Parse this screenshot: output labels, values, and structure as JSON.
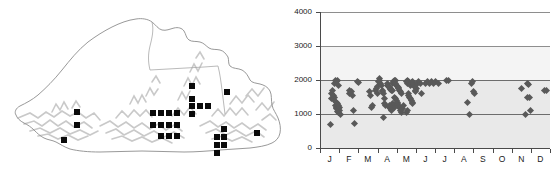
{
  "figure": {
    "panels": [
      "distribution-map",
      "altitude-month-scatter"
    ]
  },
  "map": {
    "region_name": "Bhutan",
    "outline_color": "#9a9a9a",
    "terrain_color": "#c8c8c8",
    "marker_color": "#0a0a0a",
    "marker_shape": "square",
    "marker_size_px": 6,
    "records": [
      {
        "x": 74,
        "y": 109
      },
      {
        "x": 74,
        "y": 122
      },
      {
        "x": 61,
        "y": 137
      },
      {
        "x": 150,
        "y": 110
      },
      {
        "x": 158,
        "y": 110
      },
      {
        "x": 166,
        "y": 110
      },
      {
        "x": 174,
        "y": 110
      },
      {
        "x": 150,
        "y": 122
      },
      {
        "x": 158,
        "y": 122
      },
      {
        "x": 166,
        "y": 122
      },
      {
        "x": 174,
        "y": 122
      },
      {
        "x": 158,
        "y": 133
      },
      {
        "x": 166,
        "y": 133
      },
      {
        "x": 174,
        "y": 133
      },
      {
        "x": 189,
        "y": 83
      },
      {
        "x": 189,
        "y": 96
      },
      {
        "x": 189,
        "y": 103
      },
      {
        "x": 197,
        "y": 103
      },
      {
        "x": 205,
        "y": 103
      },
      {
        "x": 189,
        "y": 111
      },
      {
        "x": 224,
        "y": 89
      },
      {
        "x": 221,
        "y": 126
      },
      {
        "x": 221,
        "y": 134
      },
      {
        "x": 214,
        "y": 134
      },
      {
        "x": 221,
        "y": 142
      },
      {
        "x": 214,
        "y": 142
      },
      {
        "x": 214,
        "y": 150
      },
      {
        "x": 254,
        "y": 130
      }
    ]
  },
  "chart_data": {
    "type": "scatter",
    "title": "",
    "xlabel": "",
    "ylabel": "",
    "xlim": [
      0,
      12
    ],
    "ylim": [
      0,
      4000
    ],
    "grid": true,
    "legend": false,
    "marker": "diamond",
    "marker_color": "#595959",
    "y_ticks": [
      0,
      1000,
      2000,
      3000,
      4000
    ],
    "y_tick_labels": [
      "0",
      "1000",
      "2000",
      "3000",
      "4000"
    ],
    "x_tick_labels": [
      "J",
      "F",
      "M",
      "A",
      "M",
      "J",
      "J",
      "A",
      "S",
      "O",
      "N",
      "D"
    ],
    "x_tick_names": [
      "January",
      "February",
      "March",
      "April",
      "May",
      "June",
      "July",
      "August",
      "September",
      "October",
      "November",
      "December"
    ],
    "points": [
      [
        0.08,
        1600
      ],
      [
        0.12,
        1450
      ],
      [
        0.28,
        1900
      ],
      [
        0.32,
        2000
      ],
      [
        0.38,
        1950
      ],
      [
        0.4,
        2000
      ],
      [
        0.44,
        1850
      ],
      [
        0.3,
        1250
      ],
      [
        0.34,
        1200
      ],
      [
        0.36,
        1150
      ],
      [
        0.42,
        1300
      ],
      [
        0.46,
        1250
      ],
      [
        0.48,
        1150
      ],
      [
        0.5,
        1100
      ],
      [
        0.52,
        1180
      ],
      [
        0.4,
        1080
      ],
      [
        0.44,
        1050
      ],
      [
        0.36,
        1350
      ],
      [
        0.26,
        1500
      ],
      [
        0.22,
        1420
      ],
      [
        0.18,
        1550
      ],
      [
        0.16,
        1700
      ],
      [
        0.06,
        700
      ],
      [
        0.58,
        1000
      ],
      [
        1.02,
        1600
      ],
      [
        1.06,
        1700
      ],
      [
        1.12,
        1650
      ],
      [
        1.18,
        1550
      ],
      [
        1.24,
        1100
      ],
      [
        1.3,
        720
      ],
      [
        1.46,
        1950
      ],
      [
        1.5,
        1930
      ],
      [
        2.08,
        1650
      ],
      [
        2.12,
        1550
      ],
      [
        2.2,
        1200
      ],
      [
        2.26,
        1250
      ],
      [
        2.4,
        1700
      ],
      [
        2.44,
        1750
      ],
      [
        2.48,
        1800
      ],
      [
        2.52,
        1600
      ],
      [
        2.56,
        1950
      ],
      [
        2.6,
        2050
      ],
      [
        2.62,
        2000
      ],
      [
        2.66,
        1900
      ],
      [
        2.7,
        1850
      ],
      [
        2.74,
        1700
      ],
      [
        2.78,
        1650
      ],
      [
        2.82,
        1600
      ],
      [
        2.86,
        1450
      ],
      [
        2.88,
        1300
      ],
      [
        2.9,
        1250
      ],
      [
        2.8,
        900
      ],
      [
        3.0,
        1900
      ],
      [
        3.04,
        1850
      ],
      [
        3.08,
        1800
      ],
      [
        3.12,
        1780
      ],
      [
        3.16,
        1750
      ],
      [
        3.2,
        1720
      ],
      [
        3.24,
        1700
      ],
      [
        3.28,
        1680
      ],
      [
        3.3,
        1900
      ],
      [
        3.34,
        1950
      ],
      [
        3.38,
        2000
      ],
      [
        3.42,
        1980
      ],
      [
        3.46,
        1900
      ],
      [
        3.5,
        1850
      ],
      [
        3.54,
        1800
      ],
      [
        3.58,
        1780
      ],
      [
        3.62,
        1750
      ],
      [
        3.66,
        1700
      ],
      [
        3.7,
        1650
      ],
      [
        3.74,
        1600
      ],
      [
        3.4,
        1500
      ],
      [
        3.44,
        1450
      ],
      [
        3.48,
        1400
      ],
      [
        3.52,
        1350
      ],
      [
        3.56,
        1300
      ],
      [
        3.6,
        1250
      ],
      [
        3.64,
        1200
      ],
      [
        3.68,
        1150
      ],
      [
        3.72,
        1100
      ],
      [
        3.76,
        1050
      ],
      [
        3.8,
        1150
      ],
      [
        3.84,
        1250
      ],
      [
        3.3,
        1300
      ],
      [
        3.34,
        1250
      ],
      [
        3.38,
        1200
      ],
      [
        3.2,
        1150
      ],
      [
        3.24,
        1100
      ],
      [
        3.1,
        1200
      ],
      [
        3.14,
        1250
      ],
      [
        4.0,
        1950
      ],
      [
        4.04,
        1900
      ],
      [
        4.08,
        1980
      ],
      [
        4.12,
        1950
      ],
      [
        4.16,
        1900
      ],
      [
        4.2,
        1850
      ],
      [
        4.24,
        1880
      ],
      [
        4.28,
        1920
      ],
      [
        4.32,
        1950
      ],
      [
        4.36,
        1900
      ],
      [
        4.4,
        1850
      ],
      [
        4.44,
        1800
      ],
      [
        4.1,
        1600
      ],
      [
        4.14,
        1550
      ],
      [
        4.18,
        1500
      ],
      [
        4.22,
        1450
      ],
      [
        4.26,
        1400
      ],
      [
        4.3,
        1350
      ],
      [
        4.34,
        1300
      ],
      [
        4.06,
        1100
      ],
      [
        4.02,
        1050
      ],
      [
        4.46,
        1700
      ],
      [
        4.5,
        1650
      ],
      [
        4.54,
        1750
      ],
      [
        4.6,
        1900
      ],
      [
        4.66,
        1950
      ],
      [
        4.72,
        1900
      ],
      [
        4.78,
        1600
      ],
      [
        5.0,
        1900
      ],
      [
        5.1,
        1950
      ],
      [
        5.2,
        1900
      ],
      [
        5.3,
        1950
      ],
      [
        5.4,
        1900
      ],
      [
        5.55,
        1950
      ],
      [
        5.7,
        1900
      ],
      [
        6.1,
        2000
      ],
      [
        6.2,
        1980
      ],
      [
        7.4,
        1900
      ],
      [
        7.46,
        1950
      ],
      [
        7.5,
        1650
      ],
      [
        7.54,
        1600
      ],
      [
        7.2,
        1350
      ],
      [
        7.3,
        1000
      ],
      [
        10.0,
        1750
      ],
      [
        10.35,
        1900
      ],
      [
        10.4,
        1880
      ],
      [
        10.3,
        1500
      ],
      [
        10.45,
        1480
      ],
      [
        10.2,
        1000
      ],
      [
        10.5,
        1100
      ],
      [
        11.2,
        1680
      ],
      [
        11.3,
        1700
      ]
    ]
  }
}
